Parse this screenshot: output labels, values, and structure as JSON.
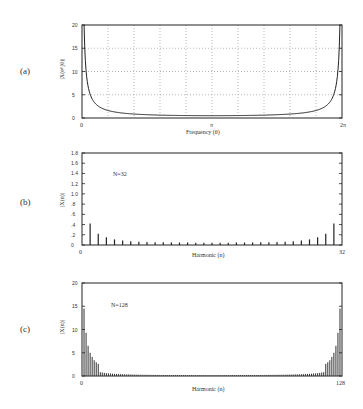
{
  "chart_data": [
    {
      "panel": "(a)",
      "type": "line",
      "title": "",
      "xlabel": "Frequency (θ)",
      "ylabel": "|X(e^jθ)|",
      "xlim": [
        0,
        6.2832
      ],
      "ylim": [
        0,
        20
      ],
      "x_tick_labels": [
        "0",
        "π",
        "2π"
      ],
      "y_tick_labels": [
        "0",
        "5",
        "10",
        "15",
        "20"
      ],
      "grid": true,
      "x": [
        0.05,
        0.1,
        0.2,
        0.3,
        0.5,
        0.75,
        1.0,
        1.5,
        2.0,
        2.5,
        3.1416,
        3.78,
        4.28,
        4.78,
        5.28,
        5.53,
        5.78,
        5.98,
        6.08,
        6.18,
        6.23
      ],
      "y": [
        20,
        10.0,
        5.0,
        3.35,
        2.04,
        1.4,
        1.09,
        0.78,
        0.64,
        0.56,
        0.5,
        0.56,
        0.64,
        0.78,
        1.09,
        1.4,
        2.04,
        3.35,
        5.0,
        10.0,
        20
      ]
    },
    {
      "panel": "(b)",
      "type": "bar",
      "title": "",
      "annotation": "N=32",
      "xlabel": "Harmonic (n)",
      "ylabel": "|X(n)|",
      "xlim": [
        0,
        32
      ],
      "ylim": [
        0,
        1.8
      ],
      "x_tick_labels": [
        "0",
        "32"
      ],
      "y_tick_labels": [
        "0",
        ".2",
        ".4",
        ".6",
        ".8",
        "1.0",
        "1.2",
        "1.4",
        "1.6",
        "1.8"
      ],
      "grid": false,
      "categories": [
        1,
        2,
        3,
        4,
        5,
        6,
        7,
        8,
        9,
        10,
        11,
        12,
        13,
        14,
        15,
        16,
        17,
        18,
        19,
        20,
        21,
        22,
        23,
        24,
        25,
        26,
        27,
        28,
        29,
        30,
        31
      ],
      "values": [
        0.42,
        0.22,
        0.15,
        0.11,
        0.09,
        0.075,
        0.066,
        0.06,
        0.055,
        0.052,
        0.05,
        0.048,
        0.047,
        0.046,
        0.045,
        0.045,
        0.045,
        0.046,
        0.047,
        0.048,
        0.05,
        0.052,
        0.055,
        0.06,
        0.066,
        0.075,
        0.09,
        0.11,
        0.15,
        0.22,
        0.42
      ]
    },
    {
      "panel": "(c)",
      "type": "bar",
      "title": "",
      "annotation": "N=128",
      "xlabel": "Harmonic (n)",
      "ylabel": "|X(n)|",
      "xlim": [
        0,
        128
      ],
      "ylim": [
        0,
        20
      ],
      "x_tick_labels": [
        "0",
        "128"
      ],
      "y_tick_labels": [
        "0",
        "5",
        "10",
        "15",
        "20"
      ],
      "grid": false,
      "description": "127 bars, symmetric about n=64: n=1≈14.5, n=2≈9.3, n=3≈6.5, n=4≈5.0, decaying to ≈0.5 at n=64",
      "values_first_8": [
        14.5,
        9.3,
        6.5,
        5.0,
        4.1,
        3.4,
        2.95,
        2.6
      ]
    }
  ],
  "labels": {
    "a": "(a)",
    "b": "(b)",
    "c": "(c)"
  }
}
